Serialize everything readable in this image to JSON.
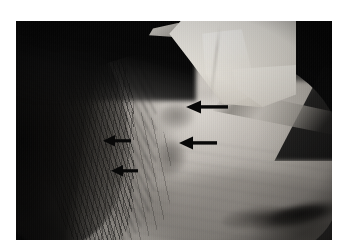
{
  "figure": {
    "type": "clinical-photograph",
    "modality": "color-photograph-grayscale",
    "caption": "",
    "alt_text": "Lateral clinical photograph of a forehead and temple with four black arrows indicating subtle skin plaques; a white gauze dressing is taped across the upper scalp.",
    "background_color": "#ffffff",
    "plate": {
      "x": 16,
      "y": 21,
      "width": 316,
      "height": 219,
      "background_color": "#050506"
    }
  },
  "annotations": {
    "arrow_color": "#080808",
    "arrow_count": 4,
    "arrows": [
      {
        "id": "arrow-1",
        "label": "arrow-upper-right",
        "direction": "left",
        "x": 169,
        "y": 76,
        "length": 38,
        "points_to": "lesion-upper"
      },
      {
        "id": "arrow-2",
        "label": "arrow-middle-right",
        "direction": "left",
        "x": 162,
        "y": 112,
        "length": 35,
        "points_to": "lesion-central"
      },
      {
        "id": "arrow-3",
        "label": "arrow-middle-left",
        "direction": "left",
        "x": 86,
        "y": 111,
        "length": 26,
        "points_to": "lesion-temple"
      },
      {
        "id": "arrow-4",
        "label": "arrow-lower-left",
        "direction": "left",
        "x": 94,
        "y": 141,
        "length": 25,
        "points_to": "lesion-lower-temple"
      }
    ]
  },
  "image_regions": {
    "gauze_dressing": {
      "name": "white-gauze-dressing",
      "position": "top-center-right",
      "color": "#ece9e2"
    },
    "strap": {
      "name": "tape-strap-band",
      "position": "upper-right-diagonal",
      "color": "#b6b1aa"
    },
    "hair": {
      "name": "hair-left-margin",
      "position": "left",
      "color": "#0a0909"
    },
    "forehead": {
      "name": "forehead-skin",
      "position": "center",
      "color": "#bbb6af"
    },
    "eyebrow": {
      "name": "eyebrow",
      "position": "lower-right",
      "color": "#0c0b0a"
    },
    "lesions": [
      {
        "id": "lesion-upper",
        "name": "plaque-upper"
      },
      {
        "id": "lesion-central",
        "name": "plaque-central"
      },
      {
        "id": "lesion-temple",
        "name": "plaque-temple"
      },
      {
        "id": "lesion-lower-temple",
        "name": "plaque-lower-temple"
      }
    ]
  }
}
